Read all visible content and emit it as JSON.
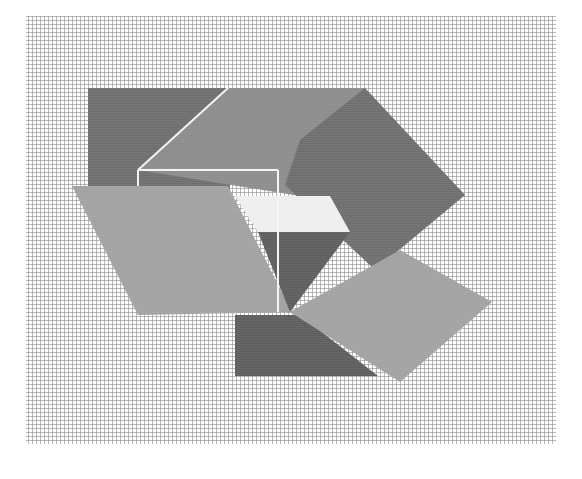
{
  "artwork": {
    "title": "Geometric plotter drawing on woven grid",
    "canvas": {
      "width": 582,
      "height": 479,
      "background": "#ffffff"
    },
    "mesh": {
      "x": 26,
      "y": 16,
      "width": 530,
      "height": 428,
      "line_color": "#8a8a8a",
      "spacing": 4
    },
    "colors": {
      "dark": "#6e6e6e",
      "darker": "#5e5e5e",
      "medium": "#8c8c8c",
      "light": "#a2a2a2",
      "window": "#eeeeee",
      "line": "#f4f4f4"
    },
    "shapes": [
      {
        "name": "top-left-dark-rectangle",
        "fill": "dark",
        "points": "88,88 230,88 230,200 88,200"
      },
      {
        "name": "top-roof-parallelogram",
        "fill": "medium",
        "points": "228,88 365,88 300,196 138,170"
      },
      {
        "name": "right-diamond",
        "fill": "dark",
        "points": "365,88 465,195 375,270 285,185 300,140"
      },
      {
        "name": "left-parallelogram",
        "fill": "light",
        "points": "72,186 228,186 292,312 138,315"
      },
      {
        "name": "window-trapezoid",
        "fill": "window",
        "points": "235,196 330,196 350,232 258,232"
      },
      {
        "name": "center-dark-triangle",
        "fill": "darker",
        "points": "258,232 350,232 290,312"
      },
      {
        "name": "bottom-dark-trapezoid",
        "fill": "darker",
        "points": "235,315 300,315 378,376 235,376"
      },
      {
        "name": "lower-right-rotated-square",
        "fill": "light",
        "points": "290,312 400,250 492,302 400,382"
      }
    ],
    "lines": [
      {
        "name": "diagonal-white-line",
        "points": "228,88 138,170"
      },
      {
        "name": "outline-top",
        "points": "138,170 278,170"
      },
      {
        "name": "outline-right",
        "points": "278,170 278,312"
      },
      {
        "name": "outline-left",
        "points": "138,170 138,186"
      }
    ]
  }
}
